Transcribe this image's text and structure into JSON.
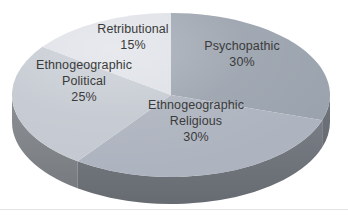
{
  "chart_data": {
    "type": "pie",
    "effect": "3d",
    "title": "",
    "start_angle_deg": 0,
    "direction": "clockwise",
    "labels_position": "inside",
    "total_percent": 100,
    "slices": [
      {
        "label": "Psychopathic",
        "value": 30,
        "color": "#9ba3ae",
        "label_text": "Psychopathic\n30%"
      },
      {
        "label": "Ethnogeographic Religious",
        "value": 30,
        "color": "#aeb4bf",
        "label_text": "Ethnogeographic\nReligious\n30%"
      },
      {
        "label": "Ethnogeographic Political",
        "value": 25,
        "color": "#c4c9d1",
        "label_text": "Ethnogeographic\nPolitical\n25%"
      },
      {
        "label": "Retributional",
        "value": 15,
        "color": "#dde0e6",
        "label_text": "Retributional\n15%"
      }
    ]
  },
  "colors": {
    "label_text": "#3a3a3a",
    "bottom_divider": "#e6e4e2",
    "background": "#ffffff"
  }
}
